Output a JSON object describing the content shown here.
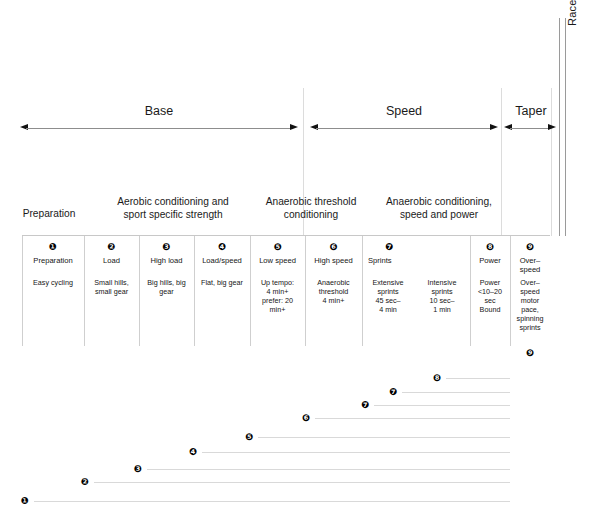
{
  "diagram": {
    "title_hidden": "Cycling training periodization chart",
    "race": {
      "label": "Race"
    }
  },
  "phases": [
    {
      "id": "base",
      "label": "Base",
      "x": 20,
      "w": 278
    },
    {
      "id": "speed",
      "label": "Speed",
      "x": 310,
      "w": 188
    },
    {
      "id": "taper",
      "label": "Taper",
      "x": 504,
      "w": 54
    }
  ],
  "blocks": [
    {
      "id": "preparation",
      "label": "Preparation",
      "x": 8,
      "w": 82
    },
    {
      "id": "aerobic",
      "label": "Aerobic conditioning and\nsport specific strength",
      "x": 92,
      "w": 162
    },
    {
      "id": "anaerobic-threshold",
      "label": "Anaerobic threshold\nconditioning",
      "x": 258,
      "w": 106
    },
    {
      "id": "anaerobic-speed",
      "label": "Anaerobic conditioning,\nspeed and power",
      "x": 368,
      "w": 142
    }
  ],
  "table": {
    "columns": [
      {
        "num": "❶",
        "title": "Preparation",
        "body": "Easy cycling",
        "x": 22,
        "w": 62,
        "title_align": "center"
      },
      {
        "num": "❷",
        "title": "Load",
        "body": "Small hills,\nsmall gear",
        "x": 84,
        "w": 55,
        "title_align": "center"
      },
      {
        "num": "❸",
        "title": "High load",
        "body": "Big hills, big\ngear",
        "x": 139,
        "w": 55,
        "title_align": "center"
      },
      {
        "num": "❹",
        "title": "Load/speed",
        "body": "Flat, big gear",
        "x": 194,
        "w": 56,
        "title_align": "center"
      },
      {
        "num": "❺",
        "title": "Low speed",
        "body": "Up tempo:\n4 min+\nprefer: 20\nmin+",
        "x": 250,
        "w": 55,
        "title_align": "center"
      },
      {
        "num": "❻",
        "title": "High speed",
        "body": "Anaerobic\nthreshold\n4 min+",
        "x": 305,
        "w": 57,
        "title_align": "center"
      },
      {
        "num": "❼",
        "title": "Sprints",
        "body": "Extensive\nsprints\n45 sec–\n4 min",
        "body2": "Intensive\nsprints\n10 sec–\n1 min",
        "x": 362,
        "w": 108,
        "title_align": "left"
      },
      {
        "num": "❽",
        "title": "Power",
        "body": "Power\n<10–20\nsec\nBound",
        "x": 470,
        "w": 40,
        "title_align": "center"
      },
      {
        "num": "❾",
        "title": "Over–\nspeed",
        "body": "Over–\nspeed\nmotor\npace,\nspinning\nsprints",
        "x": 510,
        "w": 40,
        "title_align": "center"
      }
    ],
    "footer_marker": "❾"
  },
  "chart_data": {
    "type": "line",
    "xlabel": "",
    "ylabel": "",
    "grid": false,
    "legend": "none",
    "note": "Each numbered marker starts a horizontal line that runs to the right edge of the training block; steps ascend left-to-right.",
    "steps": [
      {
        "marker": "❶",
        "label": "1",
        "x": 25,
        "y": 496,
        "line_x": 34,
        "line_w": 476
      },
      {
        "marker": "❷",
        "label": "2",
        "x": 85,
        "y": 477,
        "line_w": 416,
        "line_x": 94
      },
      {
        "marker": "❸",
        "label": "3",
        "x": 138,
        "y": 464,
        "line_w": 363,
        "line_x": 147
      },
      {
        "marker": "❹",
        "label": "4",
        "x": 193,
        "y": 447,
        "line_w": 308,
        "line_x": 202
      },
      {
        "marker": "❺",
        "label": "5",
        "x": 249,
        "y": 432,
        "line_w": 252,
        "line_x": 258
      },
      {
        "marker": "❻",
        "label": "6",
        "x": 306,
        "y": 413,
        "line_w": 195,
        "line_x": 315
      },
      {
        "marker": "❼",
        "label": "7",
        "x": 365,
        "y": 400,
        "line_w": 136,
        "line_x": 374
      },
      {
        "marker": "❼",
        "label": "7b",
        "x": 393,
        "y": 387,
        "line_w": 108,
        "line_x": 402
      },
      {
        "marker": "❽",
        "label": "8",
        "x": 437,
        "y": 373,
        "line_w": 64,
        "line_x": 446
      }
    ],
    "xlim": [
      0,
      604
    ],
    "ylim": [
      360,
      514
    ]
  },
  "colors": {
    "ink": "#111111",
    "rule": "#cfcfcf",
    "faint_rule": "#dcdcdc",
    "step_line": "#d9d9d9",
    "arrow": "#8d8d8d"
  }
}
